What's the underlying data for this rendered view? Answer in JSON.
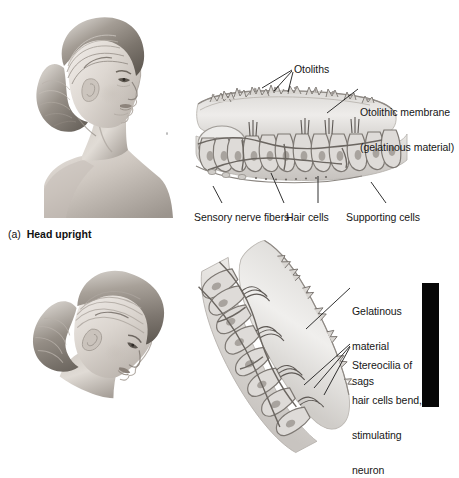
{
  "figure": {
    "kind": "anatomy-illustration",
    "background_color": "#ffffff",
    "ink_color": "#161616",
    "illustration_gray": "#8a8a8a"
  },
  "panel_a": {
    "caption_letter": "(a)",
    "caption_text": "Head upright",
    "head_image": {
      "name": "woman-head-profile-upright",
      "description": "Grayscale pencil illustration of a woman's head and shoulders in right profile, hair in an updo bun, head held upright"
    },
    "diagram": {
      "name": "macula-upright-cross-section",
      "description": "Cross-section of a macula: otolithic membrane layer with otolith crystals on top, stereocilia bundles standing straight up, hair cells and supporting cells below, sensory nerve fibers at the base"
    },
    "labels": [
      {
        "id": "otoliths",
        "text": "Otoliths"
      },
      {
        "id": "otolithic-membrane",
        "line1": "Otolithic membrane",
        "line2": "(gelatinous material)"
      },
      {
        "id": "sensory-nerve-fibers",
        "text": "Sensory nerve fibers"
      },
      {
        "id": "hair-cells",
        "text": "Hair cells"
      },
      {
        "id": "supporting-cells",
        "text": "Supporting cells"
      }
    ]
  },
  "panel_b": {
    "head_image": {
      "name": "woman-head-profile-tilted",
      "description": "Grayscale pencil illustration of the same woman's head in profile, tilted forward and downward"
    },
    "diagram": {
      "name": "macula-tilted-cross-section",
      "description": "Cross-section of the macula rotated/tilted: the gelatinous otolithic membrane slides downward and the stereocilia of the hair cells bend"
    },
    "labels": [
      {
        "id": "gelatinous-material-sags",
        "line1": "Gelatinous",
        "line2": "material",
        "line3": "sags"
      },
      {
        "id": "stereocilia-bend",
        "line1": "Stereocilia of",
        "line2": "hair cells bend,",
        "line3": "stimulating",
        "line4": "neuron"
      }
    ],
    "black_bar": {
      "id": "page-edge-black-bar",
      "color": "#070707"
    }
  }
}
